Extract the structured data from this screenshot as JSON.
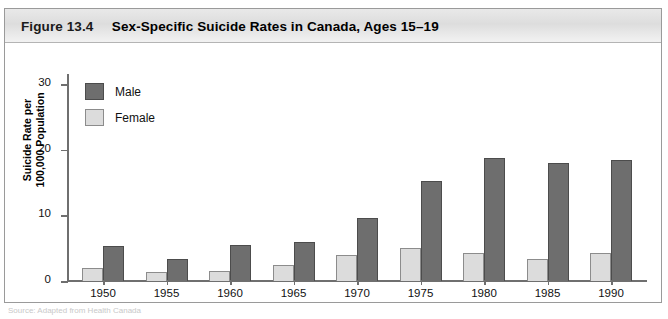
{
  "figure": {
    "number": "Figure 13.4",
    "title": "Sex-Specific Suicide Rates in Canada, Ages 15–19",
    "footnote": "Source: Adapted from Health Canada"
  },
  "legend": {
    "position": "inside-top-left",
    "items": [
      {
        "label": "Male",
        "color": "#6e6e6e"
      },
      {
        "label": "Female",
        "color": "#dcdcdc"
      }
    ]
  },
  "axes": {
    "y_title": "Suicide Rate per 100,000 Population",
    "y_title_line1": "Suicide Rate per",
    "y_title_line2": "100,000 Population",
    "y_ticks": [
      "0",
      "10",
      "20",
      "30"
    ],
    "x_labels": [
      "1950",
      "1955",
      "1960",
      "1965",
      "1970",
      "1975",
      "1980",
      "1985",
      "1990"
    ]
  },
  "chart_data": {
    "type": "bar",
    "title": "Sex-Specific Suicide Rates in Canada, Ages 15–19",
    "xlabel": "",
    "ylabel": "Suicide Rate per 100,000 Population",
    "ylim": [
      0,
      32
    ],
    "yticks": [
      0,
      10,
      20,
      30
    ],
    "grid": false,
    "legend_position": "inside-top-left",
    "categories": [
      "1950",
      "1955",
      "1960",
      "1965",
      "1970",
      "1975",
      "1980",
      "1985",
      "1990"
    ],
    "series": [
      {
        "name": "Female",
        "color": "#dcdcdc",
        "values": [
          2.0,
          1.4,
          1.5,
          2.5,
          3.9,
          5.1,
          4.2,
          3.4,
          4.3
        ]
      },
      {
        "name": "Male",
        "color": "#6e6e6e",
        "values": [
          5.3,
          3.4,
          5.5,
          5.9,
          9.6,
          15.2,
          18.8,
          18.0,
          18.4
        ]
      }
    ]
  }
}
